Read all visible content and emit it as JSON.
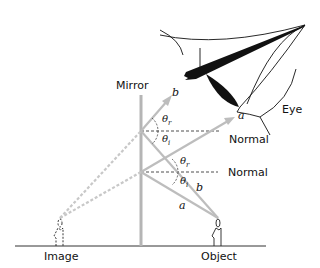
{
  "labels": {
    "mirror": "Mirror",
    "eye": "Eye",
    "image": "Image",
    "object": "Object",
    "normal_upper": "Normal",
    "normal_lower": "Normal",
    "ray_a_reflected": "a",
    "ray_b_reflected": "b",
    "ray_a_incident": "a",
    "ray_b_incident": "b",
    "theta": "θ",
    "sub_r": "r",
    "sub_i": "i"
  },
  "colors": {
    "ray": "#bdbdbd",
    "virtual_ray": "#c8c8c8",
    "mirror": "#b5b5b5",
    "ink": "#111111"
  }
}
